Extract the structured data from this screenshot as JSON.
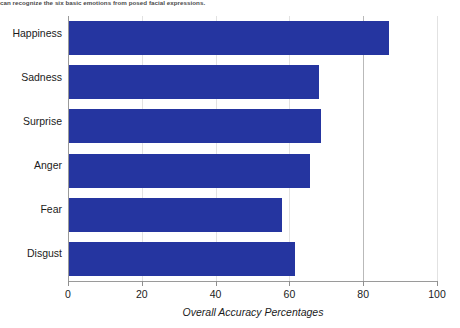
{
  "caption": {
    "text": "can recognize the six basic emotions from posed facial expressions."
  },
  "chart_data": {
    "type": "bar",
    "orientation": "horizontal",
    "title": "",
    "subtitle": "",
    "categories": [
      "Happiness",
      "Sadness",
      "Surprise",
      "Anger",
      "Fear",
      "Disgust"
    ],
    "values": [
      87,
      68,
      68.5,
      65.5,
      58,
      61.5
    ],
    "xlabel": "Overall Accuracy Percentages",
    "ylabel": "",
    "xlim": [
      0,
      100
    ],
    "xticks": [
      0,
      20,
      40,
      60,
      80,
      100
    ],
    "xtick_labels": [
      "0",
      "20",
      "40",
      "60",
      "80",
      "100"
    ],
    "grid": true,
    "grid_axis": "x",
    "legend": false,
    "legend_position": "none",
    "series": [
      {
        "name": "Overall Accuracy Percentages",
        "color": "#2535A0",
        "values": [
          87,
          68,
          68.5,
          65.5,
          58,
          61.5
        ]
      }
    ],
    "colors": {
      "bar": "#2535A0",
      "axis": "#9a9a9a",
      "gridline": "#b9b9b9",
      "text": "#1b1b1b",
      "background": "#ffffff"
    }
  }
}
